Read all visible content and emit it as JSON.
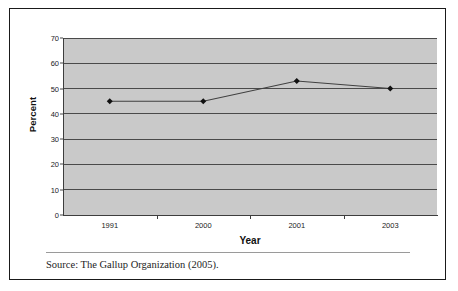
{
  "figure": {
    "source_note": "Source: The Gallup Organization (2005)."
  },
  "chart_data": {
    "type": "line",
    "title": "",
    "xlabel": "Year",
    "ylabel": "Percent",
    "categories": [
      "1991",
      "2000",
      "2001",
      "2003"
    ],
    "values": [
      45,
      45,
      53,
      50
    ],
    "series": [
      {
        "name": "Percent",
        "values": [
          45,
          45,
          53,
          50
        ]
      }
    ],
    "ylim": [
      0,
      70
    ],
    "ytick_labels": [
      "0",
      "10",
      "20",
      "30",
      "40",
      "50",
      "60",
      "70"
    ],
    "ytick_values": [
      0,
      10,
      20,
      30,
      40,
      50,
      60,
      70
    ],
    "grid": true,
    "legend": "none",
    "plot_background_color": "#c9c9c9",
    "line_color": "#404040",
    "marker_color": "#111111",
    "marker": "diamond"
  }
}
